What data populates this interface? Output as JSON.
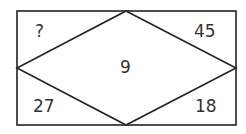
{
  "puzzle": {
    "top_left": "?",
    "top_right": "45",
    "center": "9",
    "bottom_left": "27",
    "bottom_right": "18"
  },
  "colors": {
    "stroke": "#222222",
    "text": "#333333"
  }
}
